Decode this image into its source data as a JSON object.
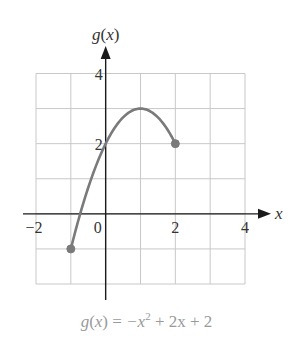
{
  "chart_data": {
    "type": "line",
    "title": "",
    "caption": {
      "fn": "g",
      "var": "x",
      "equals": "=",
      "terms": [
        "−x",
        "2",
        "+ 2x + 2"
      ],
      "full": "g(x) = −x² + 2x + 2"
    },
    "xlabel": "x",
    "ylabel": "g(x)",
    "xlim": [
      -2,
      4
    ],
    "ylim": [
      -2,
      4
    ],
    "grid": true,
    "grid_step": 1,
    "x_tick_labels": [
      {
        "value": -2,
        "label": "−2"
      },
      {
        "value": 0,
        "label": "0"
      },
      {
        "value": 2,
        "label": "2"
      },
      {
        "value": 4,
        "label": "4"
      }
    ],
    "y_tick_labels": [
      {
        "value": 2,
        "label": "2"
      },
      {
        "value": 4,
        "label": "4"
      }
    ],
    "series": [
      {
        "name": "g(x) = -x^2 + 2x + 2",
        "domain": [
          -1,
          2
        ],
        "x": [
          -1,
          -0.5,
          0,
          0.5,
          1,
          1.5,
          2
        ],
        "y": [
          -1,
          0.75,
          2,
          2.75,
          3,
          2.75,
          2
        ],
        "endpoints": [
          {
            "x": -1,
            "y": -1,
            "closed": true
          },
          {
            "x": 2,
            "y": 2,
            "closed": true
          }
        ]
      }
    ]
  },
  "colors": {
    "curve": "#7a7a7a",
    "axis": "#1a1a1a",
    "grid": "#c8c8c8",
    "caption": "#9a9a9a",
    "text": "#333333"
  }
}
